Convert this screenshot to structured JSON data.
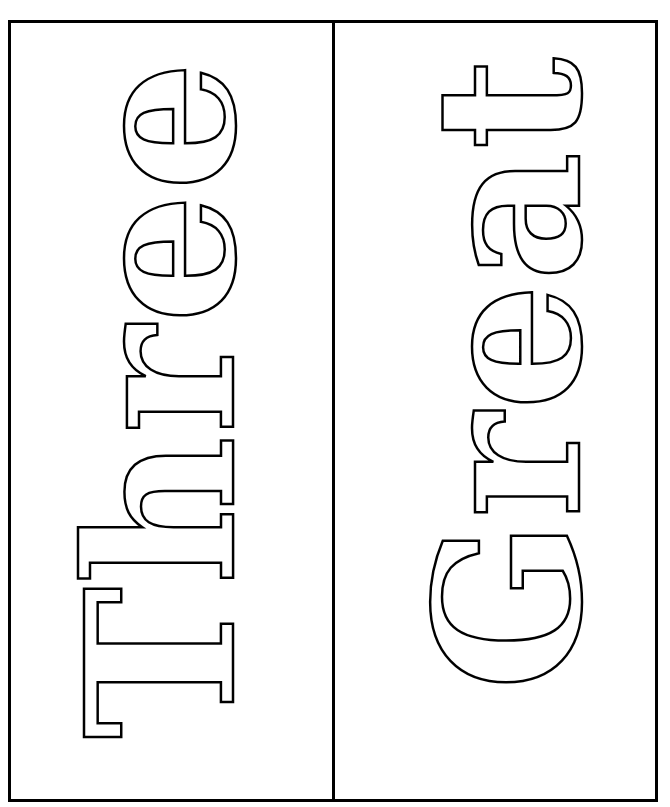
{
  "page": {
    "panels": [
      {
        "word": "Three",
        "orientation": "rotated -90deg, reads bottom-to-top",
        "style": "outline letters"
      },
      {
        "word": "Great",
        "orientation": "rotated -90deg, reads bottom-to-top",
        "style": "outline letters"
      }
    ],
    "colors": {
      "border": "#000000",
      "background": "#ffffff",
      "letter_outline": "#000000",
      "letter_fill": "#ffffff"
    }
  }
}
